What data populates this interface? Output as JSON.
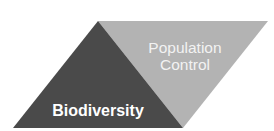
{
  "diagram": {
    "type": "parallelogram-split",
    "sections": [
      {
        "id": "biodiversity",
        "label": "Biodiversity",
        "color": "#4a4a4a"
      },
      {
        "id": "population-control",
        "label_lines": [
          "Population",
          "Control"
        ],
        "color": "#b3b3b3"
      }
    ]
  }
}
